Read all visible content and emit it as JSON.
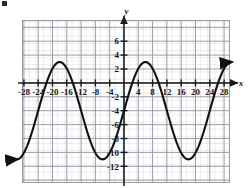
{
  "figure": {
    "label_mark": "",
    "background_color": "#ffffff",
    "grid_minor_color": "#c9ccd4",
    "grid_major_color": "#8e939c",
    "axis_color": "#1a1a1a",
    "curve_color": "#111111"
  },
  "chart_data": {
    "type": "line",
    "title": "",
    "subtitle": "",
    "xlabel": "x",
    "ylabel": "y",
    "xlim": [
      -30,
      30
    ],
    "ylim": [
      -13,
      8
    ],
    "grid": true,
    "grid_minor_step": 2,
    "grid_major_step": 4,
    "legend": "none",
    "annotations": [],
    "x_tick_labels": [
      "-28",
      "-24",
      "-20",
      "-16",
      "-12",
      "-8",
      "-4",
      "4",
      "8",
      "12",
      "16",
      "20",
      "24",
      "28"
    ],
    "x_tick_values": [
      -28,
      -24,
      -20,
      -16,
      -12,
      -8,
      -4,
      4,
      8,
      12,
      16,
      20,
      24,
      28
    ],
    "y_tick_labels": [
      "6",
      "4",
      "2",
      "-2",
      "-4",
      "-6",
      "-8",
      "-10",
      "-12"
    ],
    "y_tick_values": [
      6,
      4,
      2,
      -2,
      -4,
      -6,
      -8,
      -10,
      -12
    ],
    "series": [
      {
        "name": "sinusoid",
        "amplitude": 7,
        "midline": -4,
        "period": 24,
        "maximum_y": 3,
        "minimum_y": -11,
        "maxima_x": [
          -18,
          6,
          30
        ],
        "minima_x": [
          -6,
          18
        ],
        "arrow_start": "down-left",
        "arrow_end": "up-right",
        "x": [
          -30,
          -28,
          -26,
          -24,
          -22,
          -20,
          -18,
          -16,
          -14,
          -12,
          -10,
          -8,
          -6,
          -4,
          -2,
          0,
          2,
          4,
          6,
          8,
          10,
          12,
          14,
          16,
          18,
          20,
          22,
          24,
          26,
          28,
          30
        ],
        "values": [
          -11,
          -10.5,
          -9.0,
          -6.7,
          -4.0,
          -1.3,
          1.0,
          2.5,
          3.0,
          2.5,
          1.0,
          -1.3,
          -4.0,
          -6.7,
          -9.0,
          -10.5,
          -11,
          -10.5,
          -9.0,
          -6.7,
          -4.0,
          -1.3,
          1.0,
          2.5,
          3.0,
          2.5,
          1.0,
          -1.3,
          -4.0,
          -6.7,
          -9.0
        ]
      }
    ]
  }
}
